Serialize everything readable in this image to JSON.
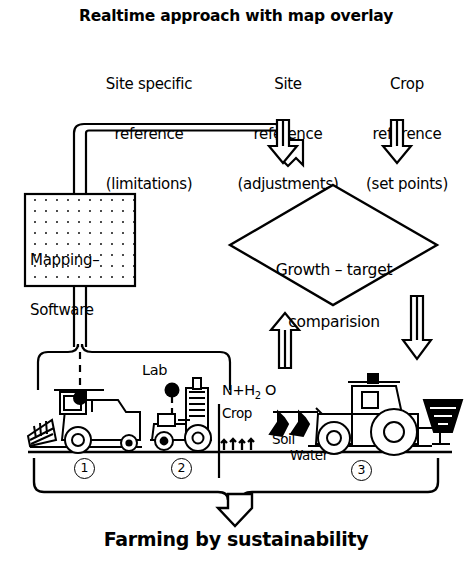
{
  "diagram": {
    "title": "Realtime approach with map overlay",
    "footer": "Farming by sustainability",
    "columns": [
      {
        "name": "site-specific-reference",
        "line1": "Site specific",
        "line2": "reference",
        "line3": "(limitations)"
      },
      {
        "name": "site-reference",
        "line1": "Site",
        "line2": "reference",
        "line3": "(adjustments)"
      },
      {
        "name": "crop-reference",
        "line1": "Crop",
        "line2": "reference",
        "line3": "(set points)"
      }
    ],
    "mapping_box": {
      "line1": "Mapping–",
      "line2": "Software"
    },
    "decision": {
      "line1": "Growth – target",
      "line2": "comparision"
    },
    "field_labels": {
      "lab": "Lab",
      "inputs": "N+H",
      "inputs_sub": "2",
      "inputs_tail": " O",
      "crop": "Crop",
      "soil": "Soil",
      "water": "Water"
    },
    "stage_numbers": [
      "1",
      "2",
      "3"
    ],
    "machines": [
      {
        "name": "combine-harvester",
        "stage": "1"
      },
      {
        "name": "sampling-tractor",
        "stage": "2"
      },
      {
        "name": "spreader-tractor",
        "stage": "3"
      }
    ],
    "colors": {
      "ink": "#000000",
      "paper": "#ffffff"
    }
  }
}
